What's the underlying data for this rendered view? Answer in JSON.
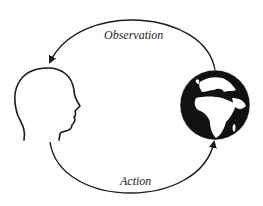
{
  "diagram": {
    "type": "agent-environment loop",
    "nodes": [
      {
        "id": "agent",
        "icon": "human-head-profile-icon"
      },
      {
        "id": "environment",
        "icon": "earth-globe-icon"
      }
    ],
    "edges": [
      {
        "from": "environment",
        "to": "agent",
        "label": "Observation"
      },
      {
        "from": "agent",
        "to": "environment",
        "label": "Action"
      }
    ]
  },
  "labels": {
    "observation": "Observation",
    "action": "Action"
  },
  "colors": {
    "stroke": "#1a1a1a",
    "globe": "#111111",
    "land": "#ffffff",
    "background": "#ffffff"
  }
}
